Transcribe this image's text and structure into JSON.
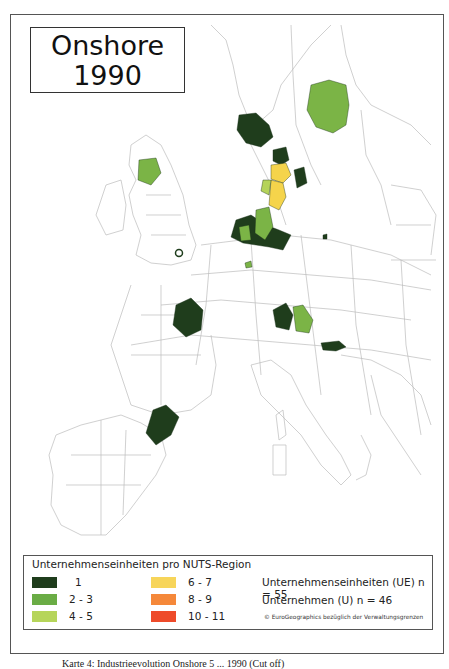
{
  "map": {
    "title_line1": "Onshore",
    "title_line2": "1990",
    "regions_colored": [
      {
        "name": "Mittelschweden",
        "class": "2-3",
        "color": "#7bb446"
      },
      {
        "name": "Südnorwegen",
        "class": "1",
        "color": "#1f3d1c"
      },
      {
        "name": "Schottland Süd",
        "class": "2-3",
        "color": "#7bb446"
      },
      {
        "name": "London",
        "class": "1",
        "color": "#1f3d1c"
      },
      {
        "name": "Nordjütland",
        "class": "1",
        "color": "#1f3d1c"
      },
      {
        "name": "Mitteljütland",
        "class": "6-7",
        "color": "#f5d44b"
      },
      {
        "name": "Süddänemark",
        "class": "6-7",
        "color": "#f5d44b"
      },
      {
        "name": "Seeland",
        "class": "1",
        "color": "#1f3d1c"
      },
      {
        "name": "Schleswig-Holstein",
        "class": "4-5",
        "color": "#b5d35a"
      },
      {
        "name": "Niedersachsen/Nordrhein-Westfalen",
        "class": "1",
        "color": "#1f3d1c"
      },
      {
        "name": "Weser-Ems",
        "class": "2-3",
        "color": "#7bb446"
      },
      {
        "name": "Centre (FR)",
        "class": "1",
        "color": "#1f3d1c"
      },
      {
        "name": "Cataluña",
        "class": "1",
        "color": "#1f3d1c"
      },
      {
        "name": "Bayern",
        "class": "1",
        "color": "#1f3d1c"
      },
      {
        "name": "Oberösterreich",
        "class": "2-3",
        "color": "#7bb446"
      },
      {
        "name": "Steiermark",
        "class": "1",
        "color": "#1f3d1c"
      }
    ]
  },
  "legend": {
    "title": "Unternehmenseinheiten pro NUTS-Region",
    "classes": [
      {
        "label": "1",
        "color": "#1f3d1c"
      },
      {
        "label": "2 - 3",
        "color": "#6aac45"
      },
      {
        "label": "4 - 5",
        "color": "#b6d55a"
      },
      {
        "label": "6 - 7",
        "color": "#f7d55a"
      },
      {
        "label": "8 - 9",
        "color": "#f5883a"
      },
      {
        "label": "10 - 11",
        "color": "#ee4b2a"
      }
    ],
    "stat_ue": "Unternehmenseinheiten (UE) n = 55",
    "stat_u": "Unternehmen (U) n = 46",
    "copyright": "© EuroGeographics bezüglich der Verwaltungsgrenzen"
  },
  "caption": "Karte 4: Industrieevolution Onshore 5 ... 1990 (Cut off)"
}
